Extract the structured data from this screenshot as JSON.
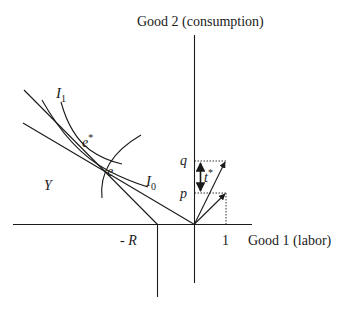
{
  "axes": {
    "y_label": "Good 2 (consumption)",
    "x_label": "Good 1 (labor)",
    "x_tick_one": "1",
    "x_tick_neg_r_prefix": "- ",
    "x_tick_neg_r": "R"
  },
  "points": {
    "e": "e",
    "e_star_base": "e",
    "e_star_sup": "*"
  },
  "curves": {
    "i1_base": "I",
    "i1_sub": "1",
    "i0_base": "I",
    "i0_sub": "0"
  },
  "regions": {
    "production_set": "Y"
  },
  "prices": {
    "q": "q",
    "p": "p",
    "tax_base": "t",
    "tax_sup": "*"
  },
  "colors": {
    "ink": "#1a1a1a",
    "background": "#ffffff"
  }
}
